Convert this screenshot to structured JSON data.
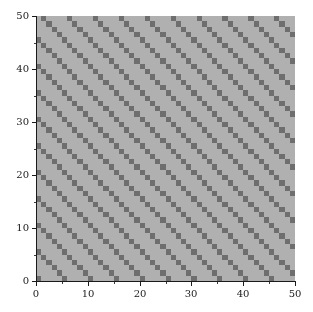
{
  "figure": {
    "width": 313,
    "height": 312,
    "background_color": "#ffffff",
    "title": "",
    "plot_area": {
      "left": 36,
      "top": 16,
      "width": 259,
      "height": 265
    }
  },
  "style": {
    "cell_light_color": "#b0b0b0",
    "cell_dark_color": "#6e6e6e",
    "axis_color": "#1a1a1a",
    "tick_color": "#1a1a1a",
    "tick_label_color": "#1a1a1a"
  },
  "axes": {
    "x": {
      "label": "",
      "limits": [
        0,
        50
      ],
      "major_ticks": [
        0,
        10,
        20,
        30,
        40,
        50
      ],
      "major_tick_labels": [
        "0",
        "10",
        "20",
        "30",
        "40",
        "50"
      ],
      "minor_ticks": [
        5,
        15,
        25,
        35,
        45
      ]
    },
    "y": {
      "label": "",
      "limits": [
        0,
        50
      ],
      "major_ticks": [
        0,
        10,
        20,
        30,
        40,
        50
      ],
      "major_tick_labels": [
        "0",
        "10",
        "20",
        "30",
        "40",
        "50"
      ],
      "minor_ticks": [
        5,
        15,
        25,
        35,
        45
      ],
      "inverted_display": false
    }
  },
  "chart_data": {
    "type": "heatmap",
    "title": "",
    "xlabel": "",
    "ylabel": "",
    "xlim": [
      0,
      50
    ],
    "ylim": [
      0,
      50
    ],
    "grid": false,
    "legend": false,
    "colorbar": false,
    "nx": 50,
    "ny": 50,
    "cell_size_x": 1,
    "cell_size_y": 1,
    "value_levels": [
      0,
      1
    ],
    "color_map": {
      "0": "#b0b0b0",
      "1": "#6e6e6e"
    },
    "pattern": {
      "description": "Anti-diagonal stripes: cell is dark (value 1) when (x + y) modulo 5 equals 0, otherwise light (value 0).",
      "rule": "(x + y) % 5 == 0",
      "modulus": 5,
      "residue": 0,
      "orientation": "anti-diagonal-ascending",
      "stripe_period_cells": 5,
      "dark_cell_count": 500,
      "light_cell_count": 2000
    },
    "x_indices_note": "x index runs 0..49 left to right; y index runs 0..49 bottom to top.",
    "dark_cells_bottom_row_x": [
      0,
      5,
      10,
      15,
      20,
      25,
      30,
      35,
      40,
      45
    ],
    "dark_cells_left_column_y": [
      0,
      5,
      10,
      15,
      20,
      25,
      30,
      35,
      40,
      45
    ]
  }
}
